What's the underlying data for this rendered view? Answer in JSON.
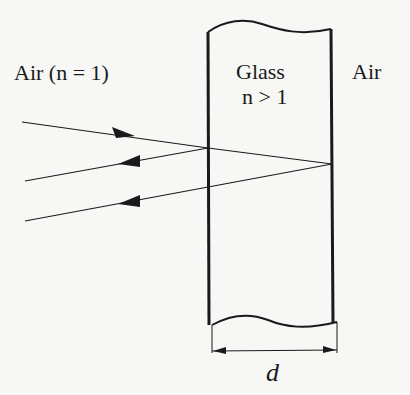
{
  "labels": {
    "left_medium": "Air (n = 1)",
    "slab_name": "Glass",
    "slab_index": "n > 1",
    "right_medium": "Air",
    "thickness": "d"
  },
  "colors": {
    "background": "#f7f7f5",
    "ink": "#1a1a1a"
  },
  "rays": [
    {
      "name": "incident",
      "direction": "right"
    },
    {
      "name": "reflected-front",
      "direction": "left"
    },
    {
      "name": "reflected-back",
      "direction": "left"
    }
  ]
}
